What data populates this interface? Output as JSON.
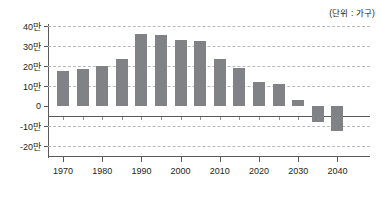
{
  "unit_caption": "(단위 : 가구)",
  "chart_data": {
    "type": "bar",
    "title": "",
    "subtitle": "",
    "xlabel": "",
    "ylabel": "",
    "unit_note": "(단위 : 가구)",
    "grid": true,
    "legend": false,
    "bar_color": "#808285",
    "axis_color": "#58595b",
    "grid_color": "#b9babc",
    "ylim": [
      -20,
      40
    ],
    "ytick_values": [
      40,
      30,
      20,
      10,
      0,
      -10,
      -20
    ],
    "ytick_labels": [
      "40만",
      "30만",
      "20만",
      "10만",
      "0",
      "-10만",
      "-20만"
    ],
    "xtick_labels": [
      "1970",
      "1980",
      "1990",
      "2000",
      "2010",
      "2020",
      "2030",
      "2040"
    ],
    "xtick_values": [
      1970,
      1980,
      1990,
      2000,
      2010,
      2020,
      2030,
      2040
    ],
    "categories": [
      1970,
      1975,
      1980,
      1985,
      1990,
      1995,
      2000,
      2005,
      2010,
      2015,
      2020,
      2025,
      2030,
      2035,
      2040
    ],
    "values": [
      17.5,
      18.3,
      20.1,
      23.4,
      35.8,
      35.7,
      32.8,
      32.3,
      23.7,
      18.9,
      11.9,
      11.0,
      3.1,
      -8.2,
      -12.6
    ]
  }
}
